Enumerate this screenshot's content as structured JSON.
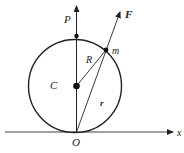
{
  "diagram": {
    "labels": {
      "P": "P",
      "F": "F",
      "m": "m",
      "R": "R",
      "C": "C",
      "r": "r",
      "O": "O",
      "x": "x"
    },
    "colors": {
      "stroke": "#222222",
      "background": "#ffffff"
    }
  }
}
